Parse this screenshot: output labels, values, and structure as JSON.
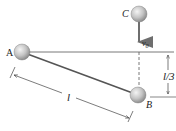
{
  "diagram": {
    "labels": {
      "A": "A",
      "B": "B",
      "C": "C",
      "v0": "v",
      "v0_sub": "0",
      "rod_length": "l",
      "drop_height": "l/3"
    },
    "colors": {
      "line": "#4a4a4a",
      "arrow": "#6e6e6e",
      "ball_light": "#f2f2f2",
      "ball_dark": "#8c8c8c",
      "text": "#222222"
    }
  }
}
